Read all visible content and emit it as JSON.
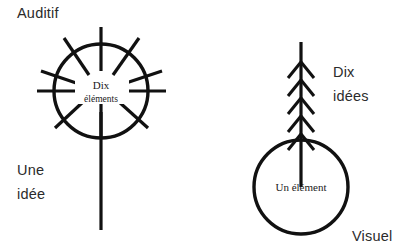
{
  "figure": {
    "title_left": "Auditif",
    "title_right": "Visuel",
    "colors": {
      "ink": "#111111",
      "text": "#2b2b2b",
      "background": "#ffffff"
    },
    "left_figure": {
      "name": "auditory-radiating-circle",
      "inner_label_line1": "Dix",
      "inner_label_line2": "éléments",
      "outer_label_line1": "Une",
      "outer_label_line2": "idée",
      "spoke_count": 10,
      "circle": {
        "cx": 101,
        "cy": 91,
        "r": 47
      },
      "stem": {
        "x": 101,
        "y_top": 91,
        "y_bottom": 230
      },
      "spoke_angles_deg": [
        90,
        54,
        18,
        -18,
        -54,
        -90,
        -126,
        -162,
        162,
        126
      ],
      "spoke_inner_r": 20,
      "spoke_outer_r": 64
    },
    "right_figure": {
      "name": "visual-arrow-circle",
      "inner_label": "Un élément",
      "outer_label_line1": "Dix",
      "outer_label_line2": "idées",
      "branch_pairs": 5,
      "branch_count": 10,
      "circle": {
        "cx": 301,
        "cy": 187,
        "r": 47
      },
      "stem": {
        "x": 301,
        "y_top": 42,
        "y_bottom": 187
      },
      "branch_y_positions": [
        62,
        80,
        98,
        116,
        134
      ],
      "branch_dx": 13,
      "branch_dy": 16
    },
    "labels": {
      "auditif": {
        "x": 17,
        "y": 18
      },
      "une_idee": {
        "x": 17,
        "y": 175
      },
      "dix_idees": {
        "x": 333,
        "y": 77
      },
      "visuel": {
        "x": 352,
        "y": 241
      }
    }
  }
}
